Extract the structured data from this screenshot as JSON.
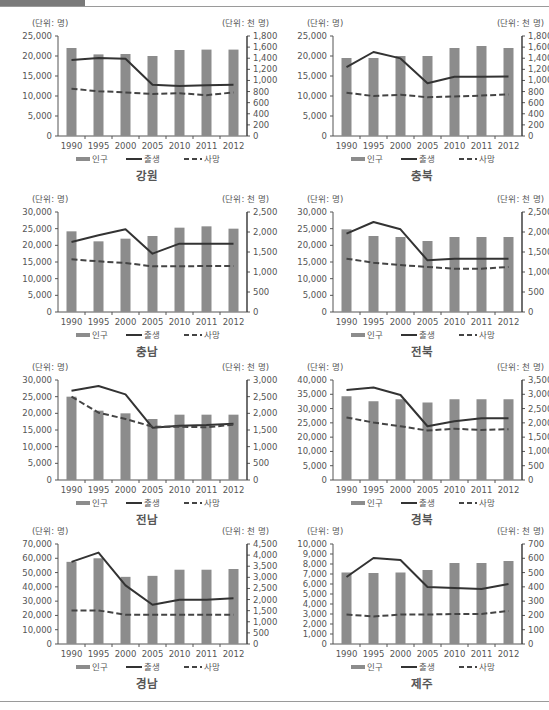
{
  "page": {
    "unit_left": "(단위: 명)",
    "unit_right": "(단위: 천 명)",
    "legend": {
      "population": "인구",
      "births": "출생",
      "deaths": "사망"
    },
    "colors": {
      "bar": "#8c8c8c",
      "births_line": "#333333",
      "deaths_line": "#444444",
      "axis": "#555555",
      "text": "#555555"
    }
  },
  "chart_data": [
    {
      "type": "bar+line",
      "title": "강원",
      "categories": [
        "1990",
        "1995",
        "2000",
        "2005",
        "2010",
        "2011",
        "2012"
      ],
      "left_axis": {
        "label": "(단위: 명)",
        "ylim": [
          0,
          25000
        ],
        "ticks": [
          "0",
          "5,000",
          "10,000",
          "15,000",
          "20,000",
          "25,000"
        ]
      },
      "right_axis": {
        "label": "(단위: 천 명)",
        "ylim": [
          0,
          1800
        ],
        "ticks": [
          "0",
          "200",
          "400",
          "600",
          "800",
          "1,000",
          "1,200",
          "1,400",
          "1,600",
          "1,800"
        ]
      },
      "series": [
        {
          "name": "인구",
          "kind": "bar",
          "values": [
            22000,
            20400,
            20500,
            20000,
            21500,
            21600,
            21600
          ]
        },
        {
          "name": "출생",
          "kind": "line",
          "style": "solid",
          "values": [
            19000,
            19500,
            19300,
            12800,
            12500,
            12700,
            12800
          ]
        },
        {
          "name": "사망",
          "kind": "line",
          "style": "dashed",
          "values": [
            11800,
            11200,
            10900,
            10500,
            10700,
            10200,
            10900
          ]
        }
      ],
      "legend_position": "bottom"
    },
    {
      "type": "bar+line",
      "title": "충북",
      "categories": [
        "1990",
        "1995",
        "2000",
        "2005",
        "2010",
        "2011",
        "2012"
      ],
      "left_axis": {
        "label": "(단위: 명)",
        "ylim": [
          0,
          25000
        ],
        "ticks": [
          "0",
          "5,000",
          "10,000",
          "15,000",
          "20,000",
          "25,000"
        ]
      },
      "right_axis": {
        "label": "(단위: 천 명)",
        "ylim": [
          0,
          1800
        ],
        "ticks": [
          "0",
          "200",
          "400",
          "600",
          "800",
          "1,000",
          "1,200",
          "1,400",
          "1,600",
          "1,800"
        ]
      },
      "series": [
        {
          "name": "인구",
          "kind": "bar",
          "values": [
            19500,
            19500,
            20000,
            20000,
            22000,
            22500,
            22000
          ]
        },
        {
          "name": "출생",
          "kind": "line",
          "style": "solid",
          "values": [
            17200,
            21000,
            19400,
            13200,
            14800,
            14800,
            14900
          ]
        },
        {
          "name": "사망",
          "kind": "line",
          "style": "dashed",
          "values": [
            10800,
            10000,
            10300,
            9700,
            9900,
            10100,
            10400
          ]
        }
      ],
      "legend_position": "bottom"
    },
    {
      "type": "bar+line",
      "title": "충남",
      "categories": [
        "1990",
        "1995",
        "2000",
        "2005",
        "2010",
        "2011",
        "2012"
      ],
      "left_axis": {
        "label": "(단위: 명)",
        "ylim": [
          0,
          30000
        ],
        "ticks": [
          "0",
          "5,000",
          "10,000",
          "15,000",
          "20,000",
          "25,000",
          "30,000"
        ]
      },
      "right_axis": {
        "label": "(단위: 천 명)",
        "ylim": [
          0,
          2500
        ],
        "ticks": [
          "0",
          "500",
          "1,000",
          "1,500",
          "2,000",
          "2,500"
        ]
      },
      "series": [
        {
          "name": "인구",
          "kind": "bar",
          "values": [
            24200,
            21200,
            22000,
            22800,
            25300,
            25700,
            25000
          ]
        },
        {
          "name": "출생",
          "kind": "line",
          "style": "solid",
          "values": [
            21000,
            23000,
            24800,
            17500,
            20500,
            20500,
            20500
          ]
        },
        {
          "name": "사망",
          "kind": "line",
          "style": "dashed",
          "values": [
            15800,
            15200,
            14700,
            13700,
            13700,
            13800,
            13800
          ]
        }
      ],
      "legend_position": "bottom"
    },
    {
      "type": "bar+line",
      "title": "전북",
      "categories": [
        "1990",
        "1995",
        "2000",
        "2005",
        "2010",
        "2011",
        "2012"
      ],
      "left_axis": {
        "label": "(단위: 명)",
        "ylim": [
          0,
          30000
        ],
        "ticks": [
          "0",
          "5,000",
          "10,000",
          "15,000",
          "20,000",
          "25,000",
          "30,000"
        ]
      },
      "right_axis": {
        "label": "(단위: 천 명)",
        "ylim": [
          0,
          2500
        ],
        "ticks": [
          "0",
          "500",
          "1,000",
          "1,500",
          "2,000",
          "2,500"
        ]
      },
      "series": [
        {
          "name": "인구",
          "kind": "bar",
          "values": [
            24800,
            22800,
            22500,
            21300,
            22500,
            22500,
            22500
          ]
        },
        {
          "name": "출생",
          "kind": "line",
          "style": "solid",
          "values": [
            23500,
            27000,
            24800,
            15500,
            16000,
            16000,
            16000
          ]
        },
        {
          "name": "사망",
          "kind": "line",
          "style": "dashed",
          "values": [
            16000,
            14800,
            14100,
            13500,
            13000,
            13000,
            13500
          ]
        }
      ],
      "legend_position": "bottom"
    },
    {
      "type": "bar+line",
      "title": "전남",
      "categories": [
        "1990",
        "1995",
        "2000",
        "2005",
        "2010",
        "2011",
        "2012"
      ],
      "left_axis": {
        "label": "(단위: 명)",
        "ylim": [
          0,
          30000
        ],
        "ticks": [
          "0",
          "5,000",
          "10,000",
          "15,000",
          "20,000",
          "25,000",
          "30,000"
        ]
      },
      "right_axis": {
        "label": "(단위: 천 명)",
        "ylim": [
          0,
          3000
        ],
        "ticks": [
          "0",
          "500",
          "1,000",
          "1,500",
          "2,000",
          "2,500",
          "3,000"
        ]
      },
      "series": [
        {
          "name": "인구",
          "kind": "bar",
          "values": [
            25000,
            20800,
            20000,
            18300,
            19600,
            19600,
            19600
          ]
        },
        {
          "name": "출생",
          "kind": "line",
          "style": "solid",
          "values": [
            26800,
            28200,
            25700,
            15700,
            16300,
            16500,
            16900
          ]
        },
        {
          "name": "사망",
          "kind": "line",
          "style": "dashed",
          "values": [
            25000,
            20200,
            18300,
            16000,
            16000,
            15800,
            16600
          ]
        }
      ],
      "legend_position": "bottom"
    },
    {
      "type": "bar+line",
      "title": "경북",
      "categories": [
        "1990",
        "1995",
        "2000",
        "2005",
        "2010",
        "2011",
        "2012"
      ],
      "left_axis": {
        "label": "(단위: 명)",
        "ylim": [
          0,
          40000
        ],
        "ticks": [
          "0",
          "5,000",
          "10,000",
          "20,000",
          "25,000",
          "30,000",
          "35,000",
          "40,000"
        ]
      },
      "right_axis": {
        "label": "(단위: 천 명)",
        "ylim": [
          0,
          3500
        ],
        "ticks": [
          "0",
          "500",
          "1,000",
          "1,500",
          "2,000",
          "2,500",
          "3,000",
          "3,500"
        ]
      },
      "series": [
        {
          "name": "인구",
          "kind": "bar",
          "values": [
            33500,
            31500,
            32300,
            31000,
            32300,
            32300,
            32300
          ]
        },
        {
          "name": "출생",
          "kind": "line",
          "style": "solid",
          "values": [
            36000,
            37000,
            34000,
            21500,
            23500,
            24700,
            24700
          ]
        },
        {
          "name": "사망",
          "kind": "line",
          "style": "dashed",
          "values": [
            25000,
            23000,
            21500,
            19800,
            20500,
            20000,
            20300
          ]
        }
      ],
      "legend_position": "bottom"
    },
    {
      "type": "bar+line",
      "title": "경남",
      "categories": [
        "1990",
        "1995",
        "2000",
        "2005",
        "2010",
        "2011",
        "2012"
      ],
      "left_axis": {
        "label": "(단위: 명)",
        "ylim": [
          0,
          70000
        ],
        "ticks": [
          "0",
          "10,000",
          "20,000",
          "30,000",
          "40,000",
          "50,000",
          "60,000",
          "70,000"
        ]
      },
      "right_axis": {
        "label": "(단위: 천 명)",
        "ylim": [
          0,
          4500
        ],
        "ticks": [
          "0",
          "500",
          "1,000",
          "1,500",
          "2,000",
          "2,500",
          "3,000",
          "3,500",
          "4,000",
          "4,500"
        ]
      },
      "series": [
        {
          "name": "인구",
          "kind": "bar",
          "values": [
            57500,
            60000,
            47000,
            47700,
            52000,
            52000,
            52500
          ]
        },
        {
          "name": "출생",
          "kind": "line",
          "style": "solid",
          "values": [
            57500,
            64000,
            41000,
            27500,
            31000,
            31000,
            32000
          ]
        },
        {
          "name": "사망",
          "kind": "line",
          "style": "dashed",
          "values": [
            23500,
            23500,
            20500,
            20500,
            20500,
            20500,
            20500
          ]
        }
      ],
      "legend_position": "bottom"
    },
    {
      "type": "bar+line",
      "title": "제주",
      "categories": [
        "1990",
        "1995",
        "2000",
        "2005",
        "2010",
        "2011",
        "2012"
      ],
      "left_axis": {
        "label": "(단위: 명)",
        "ylim": [
          0,
          10000
        ],
        "ticks": [
          "0",
          "1,000",
          "2,000",
          "3,000",
          "4,000",
          "5,000",
          "6,000",
          "7,000",
          "8,000",
          "9,000",
          "10,000"
        ]
      },
      "right_axis": {
        "label": "(단위: 천 명)",
        "ylim": [
          0,
          700
        ],
        "ticks": [
          "0",
          "100",
          "200",
          "300",
          "400",
          "500",
          "600",
          "700"
        ]
      },
      "series": [
        {
          "name": "인구",
          "kind": "bar",
          "values": [
            7150,
            7100,
            7150,
            7400,
            8100,
            8100,
            8300
          ]
        },
        {
          "name": "출생",
          "kind": "line",
          "style": "solid",
          "values": [
            6700,
            8600,
            8400,
            5700,
            5600,
            5500,
            6000
          ]
        },
        {
          "name": "사망",
          "kind": "line",
          "style": "dashed",
          "values": [
            2950,
            2750,
            2950,
            2950,
            3000,
            3000,
            3300
          ]
        }
      ],
      "legend_position": "bottom"
    }
  ]
}
